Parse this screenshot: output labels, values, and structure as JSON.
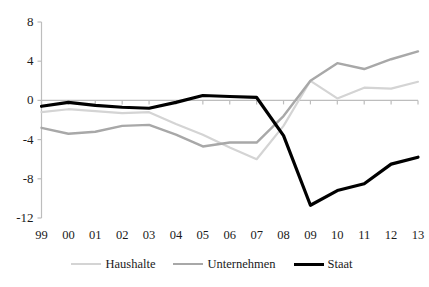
{
  "chart_data": {
    "type": "line",
    "title": "",
    "xlabel": "",
    "ylabel": "",
    "categories": [
      "99",
      "00",
      "01",
      "02",
      "03",
      "04",
      "05",
      "06",
      "07",
      "08",
      "09",
      "10",
      "11",
      "12",
      "13"
    ],
    "ylim": [
      -12,
      8
    ],
    "yticks": [
      "8",
      "4",
      "0",
      "-4",
      "-8",
      "-12"
    ],
    "ytick_values": [
      8,
      4,
      0,
      -4,
      -8,
      -12
    ],
    "grid": false,
    "zero_line": true,
    "legend_position": "bottom-center",
    "series": [
      {
        "name": "Haushalte",
        "color": "#d4d4d4",
        "width": 2.2,
        "values": [
          -1.2,
          -0.9,
          -1.1,
          -1.3,
          -1.2,
          -2.4,
          -3.5,
          -4.8,
          -6.0,
          -2.6,
          2.0,
          0.2,
          1.3,
          1.2,
          1.9
        ]
      },
      {
        "name": "Unternehmen",
        "color": "#a8a8a8",
        "width": 2.4,
        "values": [
          -2.8,
          -3.4,
          -3.2,
          -2.6,
          -2.5,
          -3.5,
          -4.7,
          -4.3,
          -4.3,
          -1.6,
          2.0,
          3.8,
          3.2,
          4.2,
          5.0
        ]
      },
      {
        "name": "Staat",
        "color": "#000000",
        "width": 3.2,
        "values": [
          -0.6,
          -0.2,
          -0.5,
          -0.7,
          -0.8,
          -0.2,
          0.5,
          0.4,
          0.3,
          -3.6,
          -10.7,
          -9.2,
          -8.5,
          -6.5,
          -5.8
        ]
      }
    ]
  },
  "legend": {
    "items": [
      {
        "label": "Haushalte",
        "color": "#d4d4d4",
        "width": 2.2
      },
      {
        "label": "Unternehmen",
        "color": "#a8a8a8",
        "width": 2.4
      },
      {
        "label": "Staat",
        "color": "#000000",
        "width": 3.4
      }
    ]
  },
  "axes": {
    "axis_color": "#bdbdbd",
    "zero_line_color": "#bdbdbd"
  }
}
